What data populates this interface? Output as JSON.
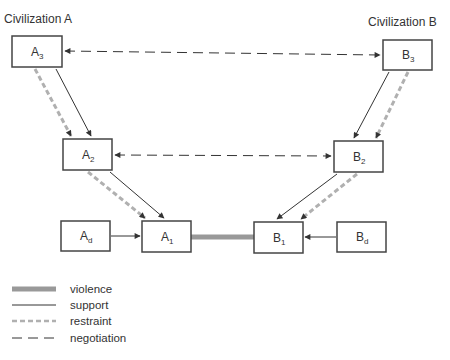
{
  "diagram": {
    "titles": {
      "civ_a": "Civilization A",
      "civ_b": "Civilization B"
    },
    "nodes": {
      "A3": {
        "main": "A",
        "sub": "3",
        "x": 12,
        "y": 36,
        "w": 50,
        "h": 31
      },
      "B3": {
        "main": "B",
        "sub": "3",
        "x": 383,
        "y": 40,
        "w": 49,
        "h": 30
      },
      "A2": {
        "main": "A",
        "sub": "2",
        "x": 63,
        "y": 139,
        "w": 49,
        "h": 31
      },
      "B2": {
        "main": "B",
        "sub": "2",
        "x": 334,
        "y": 141,
        "w": 49,
        "h": 31
      },
      "Ad": {
        "main": "A",
        "sub": "d",
        "x": 61,
        "y": 221,
        "w": 49,
        "h": 30
      },
      "A1": {
        "main": "A",
        "sub": "1",
        "x": 142,
        "y": 221,
        "w": 49,
        "h": 31
      },
      "B1": {
        "main": "B",
        "sub": "1",
        "x": 254,
        "y": 222,
        "w": 49,
        "h": 31
      },
      "Bd": {
        "main": "B",
        "sub": "d",
        "x": 337,
        "y": 222,
        "w": 49,
        "h": 30
      }
    },
    "edges": [
      {
        "from": "A3",
        "to": "B3",
        "type": "negotiation",
        "bidirectional": true
      },
      {
        "from": "A2",
        "to": "B2",
        "type": "negotiation",
        "bidirectional": true
      },
      {
        "from": "A3",
        "to": "A2",
        "type": "support"
      },
      {
        "from": "A3",
        "to": "A2",
        "type": "restraint"
      },
      {
        "from": "B3",
        "to": "B2",
        "type": "support"
      },
      {
        "from": "B3",
        "to": "B2",
        "type": "restraint"
      },
      {
        "from": "A2",
        "to": "A1",
        "type": "support"
      },
      {
        "from": "A2",
        "to": "A1",
        "type": "restraint"
      },
      {
        "from": "B2",
        "to": "B1",
        "type": "support"
      },
      {
        "from": "B2",
        "to": "B1",
        "type": "restraint"
      },
      {
        "from": "Ad",
        "to": "A1",
        "type": "support"
      },
      {
        "from": "Bd",
        "to": "B1",
        "type": "support"
      },
      {
        "from": "A1",
        "to": "B1",
        "type": "violence"
      }
    ],
    "legend": [
      {
        "type": "violence",
        "label": "violence"
      },
      {
        "type": "support",
        "label": "support"
      },
      {
        "type": "restraint",
        "label": "restraint"
      },
      {
        "type": "negotiation",
        "label": "negotiation"
      }
    ],
    "colors": {
      "box_border": "#444444",
      "support": "#333333",
      "negotiation": "#333333",
      "restraint": "#b0b0b0",
      "violence": "#999999"
    }
  }
}
